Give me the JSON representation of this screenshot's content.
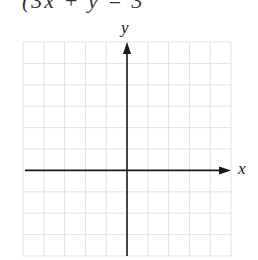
{
  "equation_fragment": "(3x + y = 3",
  "graph": {
    "x_axis_label": "x",
    "y_axis_label": "y",
    "grid": {
      "columns": 10,
      "rows": 10,
      "left": 23,
      "top": 42,
      "right": 231,
      "bottom": 256,
      "origin_col": 5,
      "origin_row": 6,
      "line_color": "#dcdcdc",
      "axis_color": "#1a1a1a"
    }
  }
}
